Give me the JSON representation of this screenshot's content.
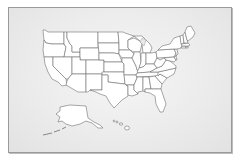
{
  "map": {
    "title": "United States",
    "style": {
      "background": "#e8e8e8",
      "state_fill": "#ffffff",
      "state_stroke": "#6f6f6f",
      "frame_border": "#9a9a9a"
    },
    "regions": [
      "Washington",
      "Oregon",
      "California",
      "Idaho",
      "Nevada",
      "Montana",
      "Wyoming",
      "Utah",
      "Arizona",
      "Colorado",
      "New Mexico",
      "North Dakota",
      "South Dakota",
      "Nebraska",
      "Kansas",
      "Oklahoma",
      "Texas",
      "Minnesota",
      "Iowa",
      "Missouri",
      "Arkansas",
      "Louisiana",
      "Wisconsin",
      "Illinois",
      "Michigan",
      "Indiana",
      "Ohio",
      "Kentucky",
      "Tennessee",
      "Mississippi",
      "Alabama",
      "Georgia",
      "Florida",
      "South Carolina",
      "North Carolina",
      "Virginia",
      "West Virginia",
      "Pennsylvania",
      "New York",
      "Maryland",
      "Delaware",
      "New Jersey",
      "Connecticut",
      "Rhode Island",
      "Massachusetts",
      "Vermont",
      "New Hampshire",
      "Maine",
      "Alaska",
      "Hawaii"
    ]
  }
}
